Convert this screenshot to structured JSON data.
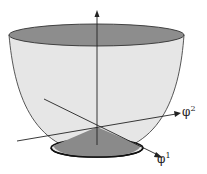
{
  "diagram": {
    "title": "",
    "axes": {
      "vertical": {
        "label": ""
      },
      "phi1": {
        "symbol": "φ",
        "superscript": "1"
      },
      "phi2": {
        "symbol": "φ",
        "superscript": "2"
      }
    },
    "colors": {
      "surface": "#e4e4e4",
      "top_cap": "#8c8c8c",
      "bottom_disk": "#8a8a8a",
      "lines": "#222222"
    }
  }
}
